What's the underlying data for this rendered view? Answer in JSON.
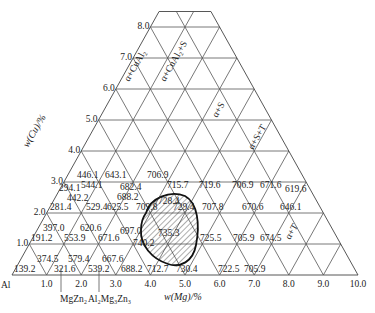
{
  "diagram": {
    "title": "",
    "geometry": {
      "origin_x": 12,
      "origin_y": 275,
      "unit_x": 34.6,
      "unit_y": 31.0,
      "top_level": 8.5,
      "right_max": 10
    },
    "corner_label": "Al",
    "x_axis": {
      "label": "w(Mg)/%",
      "ticks": [
        "1.0",
        "2.0",
        "3.0",
        "4.0",
        "5.0",
        "6.0",
        "7.0",
        "8.0",
        "9.0",
        "10.0"
      ]
    },
    "y_axis": {
      "label": "w(Cu)/%",
      "ticks": [
        "1.0",
        "2.0",
        "3.0",
        "4.0",
        "5.0",
        "6.0",
        "7.0",
        "8.0"
      ]
    },
    "phase_labels": [
      {
        "text": "α+CuAl₂",
        "x": 129,
        "y": 82
      },
      {
        "text": "α+CuAl₂+S",
        "x": 165,
        "y": 82
      },
      {
        "text": "α+S",
        "x": 217,
        "y": 118
      },
      {
        "text": "α+S+T",
        "x": 253,
        "y": 150
      },
      {
        "text": "α+T",
        "x": 290,
        "y": 240
      }
    ],
    "compound_labels": [
      {
        "text": "MgZn₂",
        "x": 60,
        "y": 302,
        "line_x": 59
      },
      {
        "text": "Al₂Mg₃Zn₃",
        "x": 88,
        "y": 302,
        "line_x": 97
      }
    ],
    "values": [
      {
        "text": "139.2",
        "x": 14,
        "y": 272
      },
      {
        "text": "374.5",
        "x": 37,
        "y": 262
      },
      {
        "text": "321.6",
        "x": 54,
        "y": 272
      },
      {
        "text": "579.4",
        "x": 68,
        "y": 262
      },
      {
        "text": "539.2",
        "x": 88,
        "y": 272
      },
      {
        "text": "667.6",
        "x": 102,
        "y": 262
      },
      {
        "text": "688.2",
        "x": 121,
        "y": 272
      },
      {
        "text": "712.7",
        "x": 147,
        "y": 272
      },
      {
        "text": "730.4",
        "x": 176,
        "y": 272
      },
      {
        "text": "722.5",
        "x": 218,
        "y": 272
      },
      {
        "text": "705.9",
        "x": 244,
        "y": 272
      },
      {
        "text": "191.2",
        "x": 31,
        "y": 241
      },
      {
        "text": "553.9",
        "x": 64,
        "y": 241
      },
      {
        "text": "671.6",
        "x": 98,
        "y": 241
      },
      {
        "text": "740.2",
        "x": 133,
        "y": 246
      },
      {
        "text": "725.5",
        "x": 200,
        "y": 241
      },
      {
        "text": "705.9",
        "x": 233,
        "y": 241
      },
      {
        "text": "674.5",
        "x": 260,
        "y": 241
      },
      {
        "text": "397.0",
        "x": 43,
        "y": 231
      },
      {
        "text": "620.6",
        "x": 80,
        "y": 231
      },
      {
        "text": "697.0",
        "x": 120,
        "y": 234
      },
      {
        "text": "735.3",
        "x": 158,
        "y": 236
      },
      {
        "text": "281.4",
        "x": 50,
        "y": 210
      },
      {
        "text": "529.4",
        "x": 86,
        "y": 210
      },
      {
        "text": "625.5",
        "x": 107,
        "y": 210
      },
      {
        "text": "709.8",
        "x": 136,
        "y": 210
      },
      {
        "text": "729.4",
        "x": 173,
        "y": 210
      },
      {
        "text": "707.8",
        "x": 202,
        "y": 210
      },
      {
        "text": "670.6",
        "x": 242,
        "y": 210
      },
      {
        "text": "646.1",
        "x": 280,
        "y": 210
      },
      {
        "text": "442.2",
        "x": 67,
        "y": 201
      },
      {
        "text": "688.2",
        "x": 117,
        "y": 200
      },
      {
        "text": "728.4",
        "x": 158,
        "y": 204
      },
      {
        "text": "294.1",
        "x": 59,
        "y": 191
      },
      {
        "text": "544.1",
        "x": 81,
        "y": 188
      },
      {
        "text": "682.4",
        "x": 120,
        "y": 190
      },
      {
        "text": "715.7",
        "x": 167,
        "y": 188
      },
      {
        "text": "719.6",
        "x": 199,
        "y": 188
      },
      {
        "text": "706.9",
        "x": 232,
        "y": 188
      },
      {
        "text": "671.6",
        "x": 260,
        "y": 188
      },
      {
        "text": "619.6",
        "x": 285,
        "y": 192
      },
      {
        "text": "446.1",
        "x": 77,
        "y": 178
      },
      {
        "text": "643.1",
        "x": 105,
        "y": 178
      },
      {
        "text": "706.9",
        "x": 147,
        "y": 178
      }
    ],
    "hatched_region": {
      "label": "shaded-region",
      "path": "M 146 213 C 150 198, 170 190, 185 196 C 198 203, 200 225, 196 245 C 193 262, 180 268, 168 264 C 152 259, 140 245, 141 230 C 141 222, 143 217, 146 213 Z"
    },
    "colors": {
      "line": "#555555",
      "text": "#222222",
      "background": "#ffffff"
    }
  }
}
